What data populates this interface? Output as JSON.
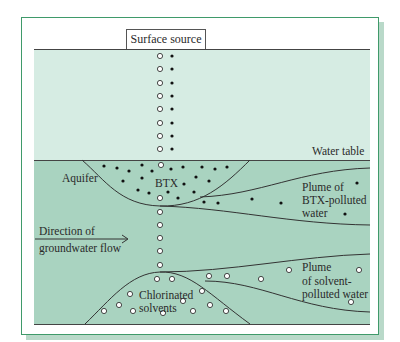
{
  "diagram": {
    "labels": {
      "surface_source": "Surface source",
      "water_table": "Water table",
      "aquifer": "Aquifer",
      "btx": "BTX",
      "plume_btx_line1": "Plume of",
      "plume_btx_line2": "BTX-polluted",
      "plume_btx_line3": "water",
      "direction_line1": "Direction of",
      "direction_line2": "groundwater flow",
      "chlorinated_line1": "Chlorinated",
      "chlorinated_line2": "solvents",
      "plume_solvent_line1": "Plume",
      "plume_solvent_line2": "of solvent-",
      "plume_solvent_line3": "polluted water"
    },
    "legend_semantics": {
      "filled_dot": "BTX",
      "open_circle": "Chlorinated solvents"
    },
    "colors": {
      "frame_border": "#3f9a6a",
      "unsaturated_zone": "#d6ece3",
      "aquifer": "#a9d3c0",
      "shadow": "#b9d9c9"
    }
  }
}
